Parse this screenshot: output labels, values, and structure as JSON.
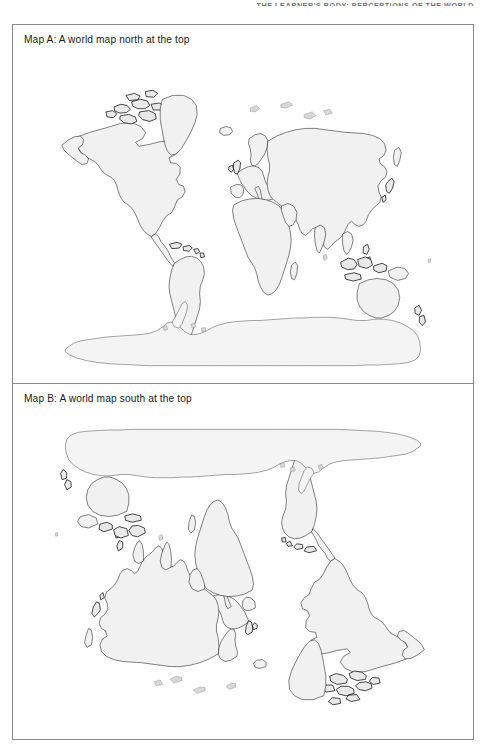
{
  "page": {
    "running_head": "THE LEARNER'S BODY: PERCEPTIONS OF THE WORLD",
    "background_color": "#ffffff",
    "frame_border_color": "#8a8a8a",
    "width": 488,
    "height": 749
  },
  "figure": {
    "panels": [
      {
        "id": "map-a",
        "caption": "Map A: A world map north at the top",
        "orientation": "north-up",
        "rotation_degrees": 0
      },
      {
        "id": "map-b",
        "caption": "Map B: A world map south at the top",
        "orientation": "south-up",
        "rotation_degrees": 180
      }
    ]
  },
  "map_style": {
    "land_fill": "#f1f1f1",
    "coastline_stroke": "#1b1b1b",
    "ocean_fill": "#ffffff",
    "projection": "equirectangular"
  },
  "map_features": {
    "landmasses": [
      "North America",
      "Greenland",
      "South America",
      "Europe",
      "Africa",
      "Asia",
      "Australia",
      "New Zealand",
      "Antarctica",
      "Madagascar",
      "Japan",
      "British Isles",
      "Iceland",
      "Indonesia",
      "Philippines",
      "Sri Lanka",
      "New Guinea"
    ]
  }
}
